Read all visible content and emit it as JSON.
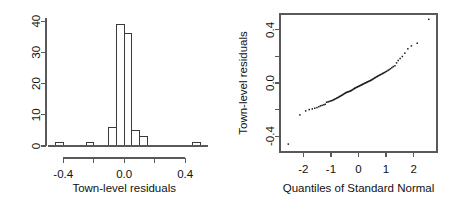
{
  "figure": {
    "type": "statistical-diagnostic-panel",
    "panel_count": 2,
    "background": "#ffffff",
    "ink_color": "#1a1a1a"
  },
  "chart_data": [
    {
      "type": "bar",
      "subtype": "histogram",
      "panel": "left",
      "title": "",
      "xlabel": "Town-level residuals",
      "ylabel": "",
      "xlim": [
        -0.5,
        0.55
      ],
      "ylim": [
        0,
        41
      ],
      "grid": false,
      "legend": null,
      "x_ticks": [
        -0.4,
        -0.2,
        0.0,
        0.2,
        0.4
      ],
      "x_tick_labels": [
        "-0.4",
        "",
        "0.0",
        "",
        "0.4"
      ],
      "x_major_labeled": [
        -0.4,
        0.0,
        0.4
      ],
      "y_ticks": [
        0,
        10,
        20,
        30,
        40
      ],
      "y_tick_labels": [
        "0",
        "10",
        "20",
        "30",
        "40"
      ],
      "bin_width": 0.05,
      "bin_edges": [
        -0.45,
        -0.4,
        -0.35,
        -0.3,
        -0.25,
        -0.2,
        -0.15,
        -0.1,
        -0.05,
        0.0,
        0.05,
        0.1,
        0.15,
        0.2,
        0.25,
        0.3,
        0.35,
        0.4,
        0.45,
        0.5
      ],
      "categories": [
        "-0.45",
        "-0.40",
        "-0.35",
        "-0.30",
        "-0.25",
        "-0.20",
        "-0.15",
        "-0.10",
        "-0.05",
        "0.00",
        "0.05",
        "0.10",
        "0.15",
        "0.20",
        "0.25",
        "0.30",
        "0.35",
        "0.40",
        "0.45"
      ],
      "values": [
        1,
        0,
        0,
        0,
        1,
        0,
        0,
        6,
        39,
        36,
        5,
        3,
        0,
        0,
        0,
        0,
        0,
        0,
        1
      ],
      "total_count": 92
    },
    {
      "type": "scatter",
      "subtype": "qq-normal-probability-plot",
      "panel": "right",
      "title": "",
      "xlabel": "Quantiles of Standard Normal",
      "ylabel": "Town-level residuals",
      "xlim": [
        -2.85,
        2.85
      ],
      "ylim": [
        -0.52,
        0.52
      ],
      "grid": false,
      "legend": null,
      "frame": "box",
      "x_ticks": [
        -2,
        -1,
        0,
        1,
        2
      ],
      "x_tick_labels": [
        "-2",
        "-1",
        "0",
        "1",
        "2"
      ],
      "y_ticks": [
        -0.4,
        -0.2,
        0.0,
        0.2,
        0.4
      ],
      "y_tick_labels": [
        "-0.4",
        "",
        "0.0",
        "",
        "0.4"
      ],
      "y_major_labeled": [
        -0.4,
        0.0,
        0.4
      ],
      "point_count": 92,
      "x": [
        -2.55,
        -2.13,
        -1.92,
        -1.79,
        -1.68,
        -1.59,
        -1.51,
        -1.44,
        -1.38,
        -1.32,
        -1.26,
        -1.21,
        -1.16,
        -1.11,
        -1.07,
        -1.02,
        -0.98,
        -0.94,
        -0.9,
        -0.87,
        -0.83,
        -0.79,
        -0.76,
        -0.72,
        -0.69,
        -0.66,
        -0.62,
        -0.59,
        -0.56,
        -0.53,
        -0.5,
        -0.47,
        -0.44,
        -0.41,
        -0.38,
        -0.35,
        -0.32,
        -0.29,
        -0.26,
        -0.23,
        -0.2,
        -0.17,
        -0.14,
        -0.12,
        -0.09,
        -0.06,
        -0.03,
        0.0,
        0.03,
        0.06,
        0.09,
        0.12,
        0.14,
        0.17,
        0.2,
        0.23,
        0.26,
        0.29,
        0.32,
        0.35,
        0.38,
        0.41,
        0.44,
        0.47,
        0.5,
        0.53,
        0.56,
        0.59,
        0.62,
        0.66,
        0.69,
        0.72,
        0.76,
        0.79,
        0.83,
        0.87,
        0.9,
        0.94,
        0.98,
        1.02,
        1.07,
        1.11,
        1.16,
        1.21,
        1.26,
        1.32,
        1.38,
        1.44,
        1.51,
        1.59,
        1.68,
        1.79,
        1.92,
        2.13,
        2.55
      ],
      "y": [
        -0.46,
        -0.24,
        -0.21,
        -0.2,
        -0.195,
        -0.19,
        -0.185,
        -0.178,
        -0.172,
        -0.168,
        -0.164,
        -0.16,
        -0.145,
        -0.142,
        -0.139,
        -0.136,
        -0.133,
        -0.13,
        -0.126,
        -0.122,
        -0.118,
        -0.114,
        -0.11,
        -0.106,
        -0.102,
        -0.098,
        -0.094,
        -0.09,
        -0.086,
        -0.082,
        -0.078,
        -0.074,
        -0.071,
        -0.068,
        -0.066,
        -0.064,
        -0.062,
        -0.06,
        -0.056,
        -0.052,
        -0.048,
        -0.044,
        -0.04,
        -0.037,
        -0.034,
        -0.031,
        -0.028,
        -0.025,
        -0.022,
        -0.019,
        -0.016,
        -0.013,
        -0.01,
        -0.007,
        -0.004,
        -0.001,
        0.002,
        0.005,
        0.008,
        0.011,
        0.014,
        0.017,
        0.02,
        0.023,
        0.027,
        0.031,
        0.035,
        0.039,
        0.043,
        0.047,
        0.051,
        0.055,
        0.059,
        0.063,
        0.067,
        0.071,
        0.075,
        0.079,
        0.084,
        0.089,
        0.095,
        0.101,
        0.108,
        0.116,
        0.124,
        0.13,
        0.152,
        0.17,
        0.185,
        0.2,
        0.225,
        0.258,
        0.28,
        0.3,
        0.48
      ]
    }
  ]
}
